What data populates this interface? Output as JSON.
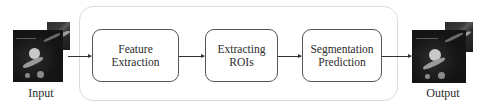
{
  "diagram": {
    "input": {
      "label": "Input"
    },
    "output": {
      "label": "Output"
    },
    "pipeline": {
      "blocks": [
        {
          "line1": "Feature",
          "line2": "Extraction"
        },
        {
          "line1": "Extracting",
          "line2": "ROIs"
        },
        {
          "line1": "Segmentation",
          "line2": "Prediction"
        }
      ]
    },
    "colors": {
      "block_border": "#555555",
      "container_border": "#dcdcdc",
      "arrow": "#333333",
      "text": "#2a2a2a"
    }
  }
}
